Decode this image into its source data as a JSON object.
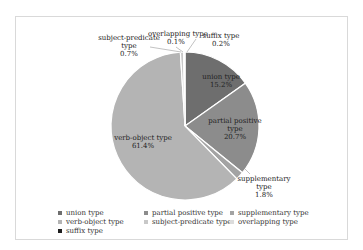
{
  "chart_data": {
    "type": "pie",
    "title": "",
    "categories": [
      "union type",
      "partial positive type",
      "supplementary type",
      "verb-object type",
      "subject-predicate type",
      "overlapping type",
      "suffix type"
    ],
    "values": [
      15.2,
      20.7,
      1.8,
      61.4,
      0.7,
      0.1,
      0.2
    ],
    "unit": "%",
    "colors": [
      "#6e6e6e",
      "#8c8c8c",
      "#a3a3a3",
      "#b4b4b4",
      "#c8c8c8",
      "#dcdcdc",
      "#1e1e1e"
    ],
    "legend_position": "bottom",
    "slice_labels": [
      {
        "name": "union type",
        "pct": "15.2%"
      },
      {
        "name": "partial positive type",
        "pct": "20.7%"
      },
      {
        "name": "supplementary type",
        "pct": "1.8%"
      },
      {
        "name": "verb-object type",
        "pct": "61.4%"
      },
      {
        "name": "subject-predicate type",
        "pct": "0.7%"
      },
      {
        "name": "overlapping type",
        "pct": "0.1%"
      },
      {
        "name": "suffix type",
        "pct": "0.2%"
      }
    ]
  },
  "labels": {
    "union_name": "union type",
    "union_pct": "15.2%",
    "partial_name1": "partial positive",
    "partial_name2": "type",
    "partial_pct": "20.7%",
    "supp_name1": "supplementary",
    "supp_name2": "type",
    "supp_pct": "1.8%",
    "verb_name": "verb-object type",
    "verb_pct": "61.4%",
    "subj_name1": "subject-predicate",
    "subj_name2": "type",
    "subj_pct": "0.7%",
    "overlap_name": "overlapping type",
    "overlap_pct": "0.1%",
    "suffix_name": "suffix type",
    "suffix_pct": "0.2%"
  },
  "legend": [
    {
      "label": "union type",
      "color": "#6e6e6e"
    },
    {
      "label": "partial positive type",
      "color": "#8c8c8c"
    },
    {
      "label": "supplementary type",
      "color": "#a3a3a3"
    },
    {
      "label": "verb-object type",
      "color": "#b4b4b4"
    },
    {
      "label": "subject-predicate type",
      "color": "#c8c8c8"
    },
    {
      "label": "overlapping type",
      "color": "#dcdcdc"
    },
    {
      "label": "suffix type",
      "color": "#1e1e1e"
    }
  ]
}
